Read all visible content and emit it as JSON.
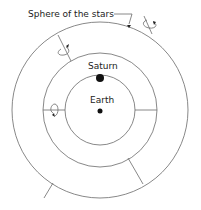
{
  "diagram": {
    "labels": {
      "stars": "Sphere of the stars",
      "saturn": "Saturn",
      "earth": "Earth"
    },
    "spheres": [
      {
        "name": "sphere-of-the-stars",
        "cx": 100,
        "cy": 110,
        "r": 88
      },
      {
        "name": "saturn-sphere",
        "cx": 100,
        "cy": 110,
        "r": 57
      },
      {
        "name": "inner-sphere",
        "cx": 100,
        "cy": 110,
        "r": 35
      }
    ],
    "bodies": [
      {
        "name": "saturn",
        "cx": 100,
        "cy": 78,
        "r": 4
      },
      {
        "name": "earth",
        "cx": 100,
        "cy": 111,
        "r": 2.5
      }
    ],
    "colors": {
      "line": "#666666",
      "body": "#111111",
      "text": "#222222"
    }
  }
}
